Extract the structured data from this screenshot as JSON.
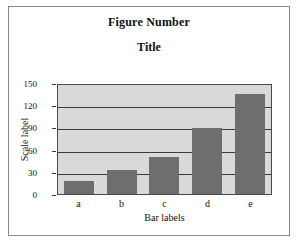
{
  "figure": {
    "figure_number": "Figure Number",
    "title": "Title"
  },
  "chart_data": {
    "type": "bar",
    "title": "Title",
    "subtitle": "Figure Number",
    "categories": [
      "a",
      "b",
      "c",
      "d",
      "e"
    ],
    "values": [
      17,
      32,
      50,
      89,
      135
    ],
    "xlabel": "Bar labels",
    "ylabel": "Scale label",
    "ylim": [
      0,
      150
    ],
    "yticks": [
      0,
      30,
      60,
      90,
      120,
      150
    ],
    "ytick_labels": [
      "0",
      "30",
      "60",
      "90",
      "120",
      "150"
    ],
    "grid": true,
    "legend": false,
    "colors": {
      "bar": "#6e6e6e",
      "plot_background": "#d9d9d9",
      "axis": "#3a3a3a",
      "frame": "#8a8a8a",
      "page_background": "#ffffff",
      "text": "#111111"
    }
  }
}
